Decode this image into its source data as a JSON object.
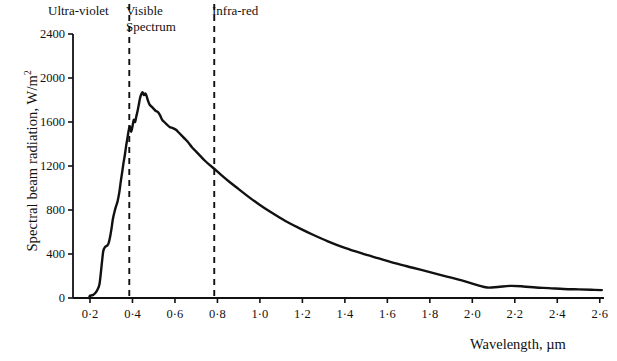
{
  "figure": {
    "y_axis": {
      "title": "Spectral beam radiation, W/m",
      "title_superscript": "2",
      "ticks": [
        0,
        400,
        800,
        1200,
        1600,
        2000,
        2400
      ],
      "tick_labels": [
        "0",
        "400",
        "800",
        "1200",
        "1600",
        "2000",
        "2400"
      ],
      "min": 0,
      "max": 2400
    },
    "x_axis": {
      "title": "Wavelength, µm",
      "ticks": [
        0.2,
        0.4,
        0.6,
        0.8,
        1.0,
        1.2,
        1.4,
        1.6,
        1.8,
        2.0,
        2.2,
        2.4,
        2.6
      ],
      "tick_labels": [
        "0·2",
        "0·4",
        "0·6",
        "0·8",
        "1·0",
        "1·2",
        "1·4",
        "1·6",
        "1·8",
        "2·0",
        "2·2",
        "2·4",
        "2·6"
      ],
      "min": 0.12,
      "max": 2.62
    },
    "bands": {
      "ultraviolet": "Ultra-violet",
      "visible_line1": "Visible",
      "visible_line2": "Spectrum",
      "infrared": "Infra-red"
    },
    "dividers": [
      0.385,
      0.785
    ],
    "colors": {
      "curve": "#111111",
      "axis": "#111111",
      "divider": "#111111",
      "background": "#ffffff"
    }
  },
  "chart_data": {
    "type": "line",
    "title": "",
    "xlabel": "Wavelength, µm",
    "ylabel": "Spectral beam radiation, W/m2",
    "xlim": [
      0.12,
      2.62
    ],
    "ylim": [
      0,
      2400
    ],
    "grid": false,
    "legend": null,
    "annotations": [
      {
        "text": "Ultra-violet",
        "x_range": [
          0.12,
          0.385
        ]
      },
      {
        "text": "Visible Spectrum",
        "x_range": [
          0.385,
          0.785
        ]
      },
      {
        "text": "Infra-red",
        "x_range": [
          0.785,
          2.62
        ]
      }
    ],
    "vertical_lines": [
      0.385,
      0.785
    ],
    "series": [
      {
        "name": "Spectral beam radiation",
        "x": [
          0.2,
          0.215,
          0.225,
          0.235,
          0.245,
          0.255,
          0.262,
          0.268,
          0.275,
          0.282,
          0.288,
          0.295,
          0.302,
          0.308,
          0.315,
          0.322,
          0.33,
          0.338,
          0.345,
          0.352,
          0.358,
          0.364,
          0.37,
          0.376,
          0.382,
          0.388,
          0.394,
          0.4,
          0.406,
          0.412,
          0.418,
          0.424,
          0.43,
          0.436,
          0.442,
          0.448,
          0.454,
          0.46,
          0.466,
          0.472,
          0.48,
          0.49,
          0.5,
          0.51,
          0.52,
          0.53,
          0.54,
          0.55,
          0.56,
          0.575,
          0.59,
          0.605,
          0.62,
          0.64,
          0.66,
          0.68,
          0.7,
          0.72,
          0.74,
          0.76,
          0.785,
          0.82,
          0.86,
          0.9,
          0.95,
          1.0,
          1.06,
          1.12,
          1.18,
          1.25,
          1.32,
          1.4,
          1.48,
          1.56,
          1.64,
          1.72,
          1.8,
          1.88,
          1.95,
          2.02,
          2.07,
          2.12,
          2.18,
          2.24,
          2.3,
          2.36,
          2.43,
          2.5,
          2.56,
          2.61
        ],
        "y": [
          20,
          28,
          45,
          75,
          130,
          300,
          420,
          455,
          470,
          478,
          500,
          560,
          640,
          720,
          780,
          830,
          880,
          960,
          1060,
          1150,
          1230,
          1300,
          1380,
          1450,
          1520,
          1560,
          1510,
          1560,
          1620,
          1600,
          1650,
          1700,
          1760,
          1820,
          1855,
          1870,
          1845,
          1860,
          1840,
          1800,
          1760,
          1740,
          1720,
          1700,
          1690,
          1660,
          1620,
          1600,
          1580,
          1555,
          1545,
          1530,
          1500,
          1460,
          1420,
          1370,
          1330,
          1290,
          1250,
          1215,
          1175,
          1115,
          1050,
          990,
          915,
          845,
          770,
          700,
          640,
          575,
          515,
          455,
          405,
          360,
          315,
          275,
          235,
          195,
          160,
          120,
          95,
          100,
          110,
          105,
          95,
          90,
          82,
          78,
          75,
          72
        ]
      }
    ]
  }
}
